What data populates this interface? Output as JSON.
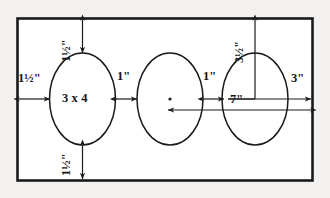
{
  "drawing": {
    "title": "Three-ellipse layout dimension drawing",
    "stroke_color": "#1a1a1a",
    "background_color": "#f2f1ef",
    "sheet_outline": "rectangle",
    "units": "inches"
  },
  "shapes": {
    "rectangle": {
      "name": "sheet-border"
    },
    "ellipses": [
      {
        "id": "ellipse-left",
        "label": "3 x 4",
        "has_center_dot": false
      },
      {
        "id": "ellipse-middle",
        "label": "",
        "has_center_dot": true
      },
      {
        "id": "ellipse-right",
        "label": "",
        "has_center_dot": false
      }
    ]
  },
  "dimensions": {
    "top_margin": {
      "name": "top-margin-dimension",
      "value": "1½\"",
      "whole": "1",
      "fraction": "½",
      "unit": "\"",
      "orientation": "vertical"
    },
    "left_margin": {
      "name": "left-margin-dimension",
      "value": "1½\"",
      "whole": "1",
      "fraction": "½",
      "unit": "\"",
      "orientation": "horizontal"
    },
    "bottom_margin": {
      "name": "bottom-margin-dimension",
      "value": "1½\"",
      "whole": "1",
      "fraction": "½",
      "unit": "\"",
      "orientation": "vertical"
    },
    "gap_left_middle": {
      "name": "gap-left-middle-dimension",
      "value": "1\"",
      "orientation": "horizontal"
    },
    "gap_middle_right": {
      "name": "gap-middle-right-dimension",
      "value": "1\"",
      "orientation": "horizontal"
    },
    "right_margin": {
      "name": "right-margin-dimension",
      "value": "3\"",
      "orientation": "horizontal"
    },
    "top_to_right_ellipse": {
      "name": "top-to-right-ellipse-dimension",
      "value": "3½\"",
      "whole": "3",
      "fraction": "½",
      "unit": "\"",
      "orientation": "vertical"
    },
    "center_to_right": {
      "name": "center-to-right-dimension",
      "value": "7\"",
      "orientation": "horizontal"
    },
    "ellipse_size": {
      "name": "ellipse-size-label",
      "value": "3 x 4"
    }
  }
}
